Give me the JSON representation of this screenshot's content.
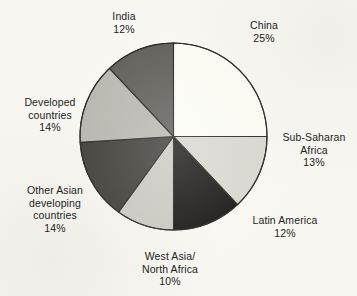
{
  "figure": {
    "background_color": "#f8f7f2",
    "outline_color": "#1b1916"
  },
  "chart_data": {
    "type": "pie",
    "title": "",
    "xlabel": "",
    "ylabel": "",
    "grid": false,
    "legend_position": "outside-labels",
    "start_angle_deg": 0,
    "direction": "clockwise",
    "units": "percent",
    "total": 100,
    "categories": [
      "China",
      "Sub-Saharan Africa",
      "Latin America",
      "West Asia/North Africa",
      "Other Asian developing countries",
      "Developed countries",
      "India"
    ],
    "values": [
      25,
      13,
      12,
      10,
      14,
      14,
      12
    ],
    "colors": [
      "#fdfdf5",
      "#d5d4cc",
      "#0a0806",
      "#c8c7bf",
      "#34302c",
      "#b3b2aa",
      "#575550"
    ],
    "slices": [
      {
        "name": "China",
        "value": 25,
        "value_label": "25%",
        "color": "#fdfdf5",
        "label_lines": [
          "China",
          "25%"
        ]
      },
      {
        "name": "Sub-Saharan Africa",
        "value": 13,
        "value_label": "13%",
        "color": "#d5d4cc",
        "label_lines": [
          "Sub-Saharan",
          "Africa",
          "13%"
        ]
      },
      {
        "name": "Latin America",
        "value": 12,
        "value_label": "12%",
        "color": "#0a0806",
        "label_lines": [
          "Latin America",
          "12%"
        ]
      },
      {
        "name": "West Asia/North Africa",
        "value": 10,
        "value_label": "10%",
        "color": "#c8c7bf",
        "label_lines": [
          "West Asia/",
          "North Africa",
          "10%"
        ]
      },
      {
        "name": "Other Asian developing countries",
        "value": 14,
        "value_label": "14%",
        "color": "#34302c",
        "label_lines": [
          "Other Asian",
          "developing",
          "countries",
          "14%"
        ]
      },
      {
        "name": "Developed countries",
        "value": 14,
        "value_label": "14%",
        "color": "#b3b2aa",
        "label_lines": [
          "Developed",
          "countries",
          "14%"
        ]
      },
      {
        "name": "India",
        "value": 12,
        "value_label": "12%",
        "color": "#575550",
        "label_lines": [
          "India",
          "12%"
        ]
      }
    ]
  }
}
